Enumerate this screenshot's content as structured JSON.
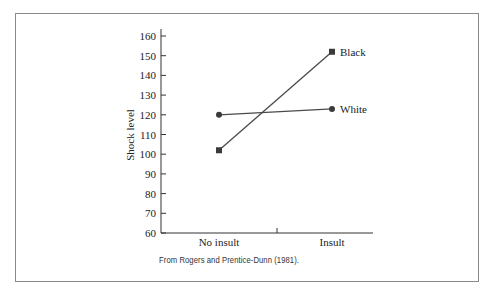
{
  "chart_data": {
    "type": "line",
    "title": "",
    "xlabel": "",
    "ylabel": "Shock level",
    "categories": [
      "No insult",
      "Insult"
    ],
    "series": [
      {
        "name": "Black",
        "marker": "square",
        "values": [
          102,
          152
        ]
      },
      {
        "name": "White",
        "marker": "circle",
        "values": [
          120,
          123
        ]
      }
    ],
    "ylim": [
      60,
      160
    ],
    "yticks": [
      60,
      70,
      80,
      90,
      100,
      110,
      120,
      130,
      140,
      150,
      160
    ],
    "grid": false,
    "legend": "inline labels at line ends",
    "caption": "From Rogers and Prentice-Dunn (1981)."
  },
  "colors": {
    "line": "#4a4a4a",
    "marker": "#3a3a3a",
    "axis": "#333333",
    "text": "#222222",
    "border": "#8a8a8a"
  }
}
